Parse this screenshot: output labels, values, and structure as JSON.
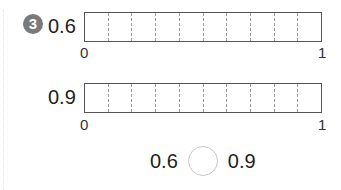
{
  "problem": {
    "number": "3",
    "rows": [
      {
        "label": "0.6",
        "divisions": 10,
        "shaded": 0,
        "start_label": "0",
        "end_label": "1"
      },
      {
        "label": "0.9",
        "divisions": 10,
        "shaded": 0,
        "start_label": "0",
        "end_label": "1"
      }
    ],
    "comparison": {
      "left": "0.6",
      "right": "0.9",
      "answer_blank": ""
    }
  }
}
